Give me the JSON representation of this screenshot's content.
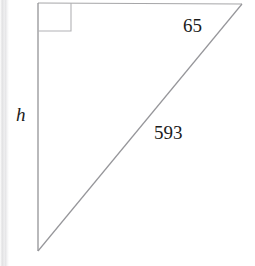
{
  "figure": {
    "type": "right-triangle-diagram",
    "background_color": "#ffffff",
    "stroke_color": "#9a9a9a",
    "text_color": "#1b1b1b",
    "width": 255,
    "height": 266,
    "vertices": {
      "top_left_right_angle": [
        38,
        3
      ],
      "top_right": [
        242,
        4
      ],
      "bottom_left": [
        38,
        251
      ]
    },
    "right_angle_marker": {
      "name": "right-angle-square",
      "x": 38,
      "y": 3,
      "size": 33
    },
    "sides": [
      {
        "name": "vertical-leg",
        "label": "h",
        "italic": true,
        "from": [
          38,
          3
        ],
        "to": [
          38,
          251
        ]
      },
      {
        "name": "top-leg",
        "label": "65",
        "italic": false,
        "from": [
          38,
          3
        ],
        "to": [
          242,
          4
        ]
      },
      {
        "name": "hypotenuse",
        "label": "593",
        "italic": false,
        "from": [
          38,
          251
        ],
        "to": [
          242,
          4
        ]
      }
    ],
    "labels": {
      "height_leg": "h",
      "top_side": "65",
      "hypotenuse": "593"
    }
  }
}
